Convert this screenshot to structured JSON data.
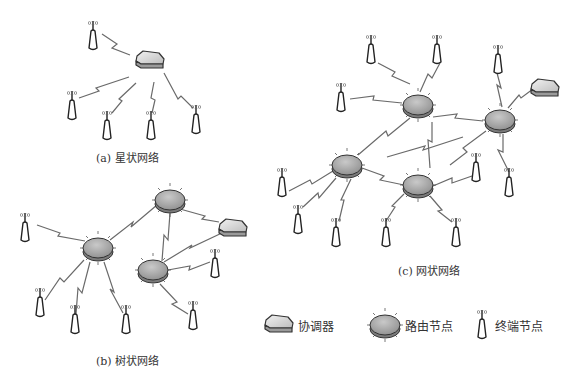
{
  "captions": {
    "star": "(a) 星状网络",
    "tree": "(b) 树状网络",
    "mesh": "(c) 网状网络"
  },
  "legend": {
    "coordinator": "协调器",
    "router": "路由节点",
    "end_device": "终端节点"
  },
  "colors": {
    "background": "#ffffff",
    "link": "#6a6a6a",
    "router_fill": "#a9a9a9",
    "router_edge": "#3a3a3a",
    "coordinator_fill": "#d8d8d8",
    "end_device_stroke": "#222222"
  },
  "networks": {
    "star": {
      "coordinator": {
        "x": 150,
        "y": 58
      },
      "end_devices": [
        {
          "x": 93,
          "y": 40
        },
        {
          "x": 72,
          "y": 110
        },
        {
          "x": 107,
          "y": 128
        },
        {
          "x": 151,
          "y": 128
        },
        {
          "x": 196,
          "y": 122
        }
      ],
      "links": [
        [
          0,
          "c"
        ],
        [
          1,
          "c"
        ],
        [
          2,
          "c"
        ],
        [
          3,
          "c"
        ],
        [
          4,
          "c"
        ]
      ]
    },
    "tree": {
      "coordinator": {
        "x": 233,
        "y": 228
      },
      "routers": [
        {
          "x": 170,
          "y": 199
        },
        {
          "x": 98,
          "y": 248
        },
        {
          "x": 153,
          "y": 270
        }
      ],
      "end_devices": [
        {
          "x": 25,
          "y": 230
        },
        {
          "x": 40,
          "y": 305
        },
        {
          "x": 75,
          "y": 322
        },
        {
          "x": 126,
          "y": 322
        },
        {
          "x": 215,
          "y": 266
        },
        {
          "x": 193,
          "y": 318
        }
      ]
    },
    "mesh": {
      "coordinator": {
        "x": 543,
        "y": 86
      },
      "routers": [
        {
          "x": 418,
          "y": 105
        },
        {
          "x": 500,
          "y": 120
        },
        {
          "x": 347,
          "y": 165
        },
        {
          "x": 418,
          "y": 185
        }
      ],
      "end_devices": [
        {
          "x": 371,
          "y": 52
        },
        {
          "x": 437,
          "y": 52
        },
        {
          "x": 498,
          "y": 62
        },
        {
          "x": 341,
          "y": 100
        },
        {
          "x": 282,
          "y": 185
        },
        {
          "x": 298,
          "y": 222
        },
        {
          "x": 336,
          "y": 235
        },
        {
          "x": 386,
          "y": 235
        },
        {
          "x": 456,
          "y": 235
        },
        {
          "x": 476,
          "y": 170
        },
        {
          "x": 509,
          "y": 185
        }
      ]
    }
  }
}
